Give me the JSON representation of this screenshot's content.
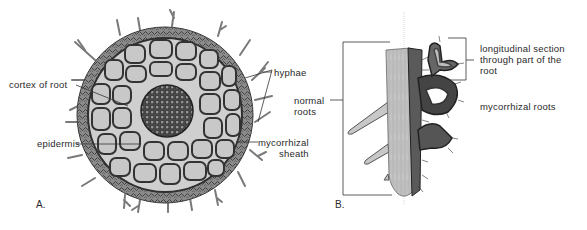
{
  "figure": {
    "panels": [
      {
        "id": "A",
        "label": "A.",
        "description": "Cross-section of a mycorrhizal root",
        "annotations": {
          "cortex": "cortex of root",
          "epidermis": "epidermis",
          "hyphae": "hyphae",
          "sheath": "mycorrhizal\nsheath"
        }
      },
      {
        "id": "B",
        "label": "B.",
        "description": "Normal roots and mycorrhizal roots",
        "annotations": {
          "normal": "normal\nroots",
          "longitudinal": "longitudinal section\nthrough part of the\nroot",
          "mycorrhizal": "mycorrhizal roots"
        }
      }
    ],
    "colors": {
      "background": "#ffffff",
      "text": "#2a2a2a",
      "cell_fill": "#c9c9c9",
      "cell_wall": "#3a3a3a",
      "sheath": "#6e6e6e",
      "root_fill": "#bdbdbd"
    }
  }
}
